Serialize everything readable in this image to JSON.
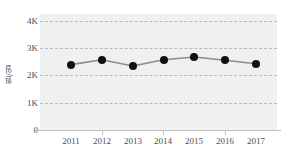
{
  "chart_data": {
    "type": "line",
    "title": "",
    "subtitle": "",
    "xlabel": "",
    "ylabel": "원/일",
    "categories": [
      "2011",
      "2012",
      "2013",
      "2014",
      "2015",
      "2016",
      "2017"
    ],
    "values": [
      2400,
      2580,
      2350,
      2580,
      2680,
      2560,
      2430
    ],
    "series": [
      {
        "name": "원/일",
        "values": [
          2400,
          2580,
          2350,
          2580,
          2680,
          2560,
          2430
        ]
      }
    ],
    "ylim": [
      0,
      4000
    ],
    "xlim": [
      "2011",
      "2017"
    ],
    "y_ticks": [
      0,
      1000,
      2000,
      3000,
      4000
    ],
    "y_tick_labels": [
      "0",
      "1K",
      "2K",
      "3K",
      "4K"
    ],
    "x_ticks": [
      "2011",
      "2012",
      "2013",
      "2014",
      "2015",
      "2016",
      "2017"
    ],
    "grid": true,
    "grid_style": "dashed",
    "grid_axis": "y",
    "legend": false,
    "legend_position": "none",
    "marker": "circle",
    "marker_color": "#111111",
    "line_color": "#8c8c8c",
    "plot_background": "#f0f0f0",
    "figure_background": "#ffffff",
    "annotations": []
  },
  "axis": {
    "y_title": "원/일",
    "y_tick_labels": [
      "4K",
      "3K",
      "2K",
      "1K",
      "0"
    ],
    "x_tick_labels": [
      "2011",
      "2012",
      "2013",
      "2014",
      "2015",
      "2016",
      "2017"
    ]
  },
  "colors": {
    "plot_bg": "#f0f0f0",
    "grid": "#b9b9b9",
    "axis_line": "#bdbdbd",
    "marker": "#111111",
    "line": "#8c8c8c",
    "tick_text": "#4e4e4e",
    "title_text": "#4a4a4a"
  }
}
